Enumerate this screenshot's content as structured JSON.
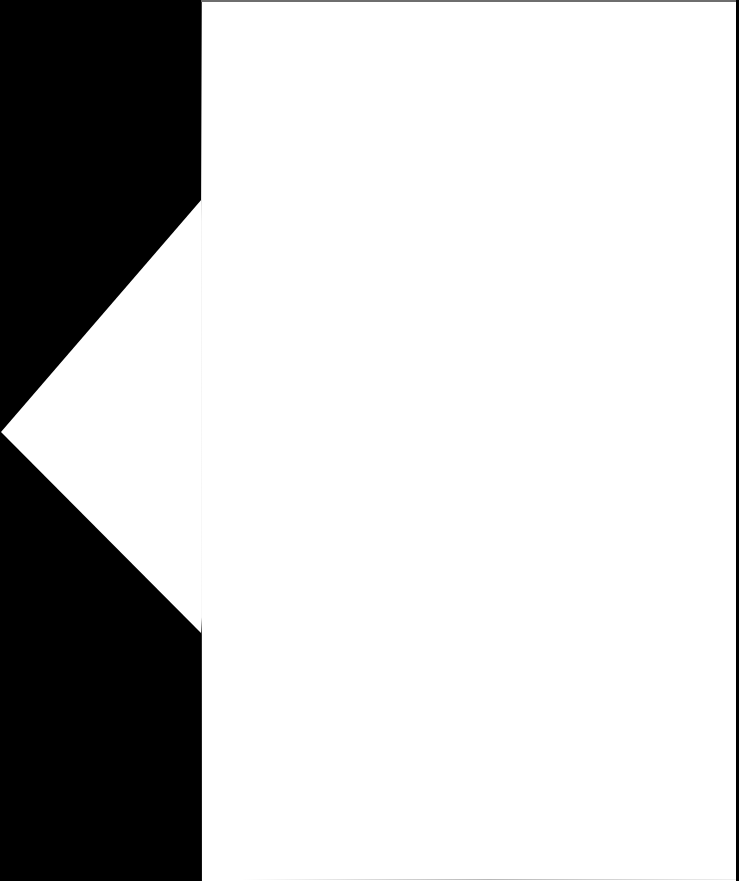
{
  "viewer": {
    "background_color": "#000000",
    "page_color": "#ffffff",
    "arrow_color": "#ffffff",
    "page_content": ""
  },
  "navigation": {
    "previous_icon": "chevron-left-icon"
  }
}
